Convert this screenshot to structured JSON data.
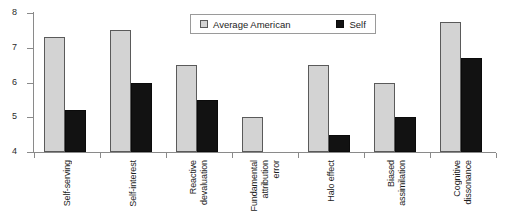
{
  "chart_data": {
    "type": "bar",
    "title": "",
    "xlabel": "",
    "ylabel": "",
    "ylim": [
      4,
      8
    ],
    "yticks": [
      4,
      5,
      6,
      7,
      8
    ],
    "grid": false,
    "legend_position": "top-center",
    "categories": [
      "Self-serving",
      "Self-interest",
      "Reactive devaluation",
      "Fundamental attribution error",
      "Halo effect",
      "Biased assimilation",
      "Cognitive dissonance"
    ],
    "category_lines": [
      [
        "Self-serving"
      ],
      [
        "Self-interest"
      ],
      [
        "Reactive",
        "devaluation"
      ],
      [
        "Fundamental",
        "attribution",
        "error"
      ],
      [
        "Halo effect"
      ],
      [
        "Biased",
        "assimilation"
      ],
      [
        "Cognitive",
        "dissonance"
      ]
    ],
    "series": [
      {
        "name": "Average American",
        "color": "#d3d3d3",
        "values": [
          7.3,
          7.5,
          6.5,
          5.0,
          6.5,
          6.0,
          7.75
        ]
      },
      {
        "name": "Self",
        "color": "#121212",
        "values": [
          5.2,
          6.0,
          5.5,
          4.0,
          4.5,
          5.0,
          6.7
        ]
      }
    ]
  },
  "legend": {
    "entries": [
      {
        "label": "Average American",
        "swatch": "light-gray-square"
      },
      {
        "label": "Self",
        "swatch": "black-square"
      }
    ]
  },
  "axis": {
    "y_tick_labels": [
      "8",
      "7",
      "6",
      "5",
      "4"
    ]
  }
}
